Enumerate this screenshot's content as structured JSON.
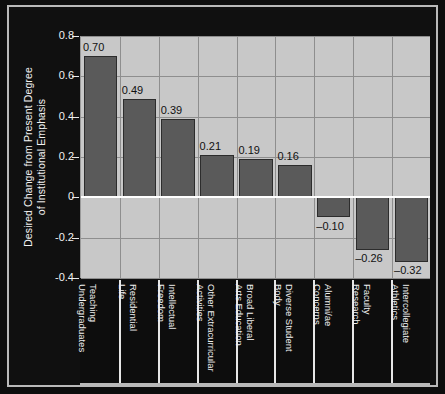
{
  "chart_data": {
    "type": "bar",
    "title": "",
    "xlabel": "",
    "ylabel": "Desired Change from Present Degree of Institutional Emphasis",
    "ylabel_line1": "Desired Change from Present Degree",
    "ylabel_line2": "of Institutional Emphasis",
    "ylim": [
      -0.4,
      0.8
    ],
    "ytick_labels": [
      "0.8",
      "0.6",
      "0.4",
      "0.2",
      "0",
      "-0.2",
      "-0.4"
    ],
    "ytick_values": [
      0.8,
      0.6,
      0.4,
      0.2,
      0,
      -0.2,
      -0.4
    ],
    "grid": true,
    "legend": "none",
    "zero_line": true,
    "categories": [
      "Teaching Undergraduates",
      "Residential Life",
      "Intellectual Freedom",
      "Other Extracurricular Activities",
      "Broad Liberal Arts Education",
      "Diverse Student Body",
      "Alumni/ae Concerns",
      "Faculty Research",
      "Intercollegiate Athletics"
    ],
    "category_lines": [
      [
        "Teaching",
        "Undergraduates"
      ],
      [
        "Residential",
        "Life"
      ],
      [
        "Intellectual",
        "Freedom"
      ],
      [
        "Other Extracurricular",
        "Activities"
      ],
      [
        "Broad Liberal",
        "Arts Education"
      ],
      [
        "Diverse Student",
        "Body"
      ],
      [
        "Alumni/ae",
        "Concerns"
      ],
      [
        "Faculty",
        "Research"
      ],
      [
        "Intercollegiate",
        "Athletics"
      ]
    ],
    "values": [
      0.7,
      0.49,
      0.39,
      0.21,
      0.19,
      0.16,
      -0.1,
      -0.26,
      -0.32
    ],
    "value_labels": [
      "0.70",
      "0.49",
      "0.39",
      "0.21",
      "0.19",
      "0.16",
      "–0.10",
      "–0.26",
      "–0.32"
    ],
    "colors": {
      "bar_fill": "#5a5a5a",
      "bar_edge": "#2c2c2c",
      "plot_background": "#c8c8c8",
      "figure_background": "#0d0d0d",
      "gridline": "#8e8e8e",
      "zero_line": "#ffffff",
      "axis_text": "#f2f2f2",
      "value_label_text": "#111111",
      "frame_border": "#b9b9b9"
    }
  }
}
